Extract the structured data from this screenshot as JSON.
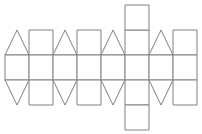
{
  "figure": {
    "background_color": "#ffffff",
    "stroke_color": "#808080",
    "fill_color": "#ffffff",
    "stroke_width": 1,
    "canvas": {
      "width": 202,
      "height": 134
    }
  },
  "grid": {
    "origin_x": 5,
    "origin_y": 5,
    "cell_width": 24,
    "cell_height": 25,
    "columns": 8,
    "row_tops": [
      5,
      30,
      55,
      80,
      105
    ],
    "band_row_index": 2,
    "tall_column_index": 5
  },
  "shapes": [
    {
      "id": "tri-top-1",
      "kind": "triangle",
      "orientation": "up",
      "column": 0,
      "row": 1,
      "points": "5,55 17,30 29,55"
    },
    {
      "id": "sq-top-2",
      "kind": "square",
      "orientation": "none",
      "column": 1,
      "row": 1,
      "points": "29,30 53,30 53,55 29,55"
    },
    {
      "id": "tri-top-3",
      "kind": "triangle",
      "orientation": "up",
      "column": 2,
      "row": 1,
      "points": "53,55 65,30 77,55"
    },
    {
      "id": "sq-top-4",
      "kind": "square",
      "orientation": "none",
      "column": 3,
      "row": 1,
      "points": "77,30 101,30 101,55 77,55"
    },
    {
      "id": "tri-top-5",
      "kind": "triangle",
      "orientation": "up",
      "column": 4,
      "row": 1,
      "points": "101,55 113,30 125,55"
    },
    {
      "id": "sq-top-6",
      "kind": "square",
      "orientation": "none",
      "column": 5,
      "row": 1,
      "points": "125,30 149,30 149,55 125,55"
    },
    {
      "id": "tri-top-7",
      "kind": "triangle",
      "orientation": "up",
      "column": 6,
      "row": 1,
      "points": "149,55 161,30 173,55"
    },
    {
      "id": "sq-top-8",
      "kind": "square",
      "orientation": "none",
      "column": 7,
      "row": 1,
      "points": "173,30 197,30 197,55 173,55"
    },
    {
      "id": "sq-extra-top",
      "kind": "square",
      "orientation": "none",
      "column": 5,
      "row": 0,
      "points": "125,5 149,5 149,30 125,30"
    },
    {
      "id": "band-sq-1",
      "kind": "square",
      "orientation": "none",
      "column": 0,
      "row": 2,
      "points": "5,55 29,55 29,80 5,80"
    },
    {
      "id": "band-sq-2",
      "kind": "square",
      "orientation": "none",
      "column": 1,
      "row": 2,
      "points": "29,55 53,55 53,80 29,80"
    },
    {
      "id": "band-sq-3",
      "kind": "square",
      "orientation": "none",
      "column": 2,
      "row": 2,
      "points": "53,55 77,55 77,80 53,80"
    },
    {
      "id": "band-sq-4",
      "kind": "square",
      "orientation": "none",
      "column": 3,
      "row": 2,
      "points": "77,55 101,55 101,80 77,80"
    },
    {
      "id": "band-sq-5",
      "kind": "square",
      "orientation": "none",
      "column": 4,
      "row": 2,
      "points": "101,55 125,55 125,80 101,80"
    },
    {
      "id": "band-sq-6",
      "kind": "square",
      "orientation": "none",
      "column": 5,
      "row": 2,
      "points": "125,55 149,55 149,80 125,80"
    },
    {
      "id": "band-sq-7",
      "kind": "square",
      "orientation": "none",
      "column": 6,
      "row": 2,
      "points": "149,55 173,55 173,80 149,80"
    },
    {
      "id": "band-sq-8",
      "kind": "square",
      "orientation": "none",
      "column": 7,
      "row": 2,
      "points": "173,55 197,55 197,80 173,80"
    },
    {
      "id": "tri-bot-1",
      "kind": "triangle",
      "orientation": "down",
      "column": 0,
      "row": 3,
      "points": "5,80 29,80 17,105"
    },
    {
      "id": "sq-bot-2",
      "kind": "square",
      "orientation": "none",
      "column": 1,
      "row": 3,
      "points": "29,80 53,80 53,105 29,105"
    },
    {
      "id": "tri-bot-3",
      "kind": "triangle",
      "orientation": "down",
      "column": 2,
      "row": 3,
      "points": "53,80 77,80 65,105"
    },
    {
      "id": "sq-bot-4",
      "kind": "square",
      "orientation": "none",
      "column": 3,
      "row": 3,
      "points": "77,80 101,80 101,105 77,105"
    },
    {
      "id": "tri-bot-5",
      "kind": "triangle",
      "orientation": "down",
      "column": 4,
      "row": 3,
      "points": "101,80 125,80 113,105"
    },
    {
      "id": "sq-bot-6",
      "kind": "square",
      "orientation": "none",
      "column": 5,
      "row": 3,
      "points": "125,80 149,80 149,105 125,105"
    },
    {
      "id": "tri-bot-7",
      "kind": "triangle",
      "orientation": "down",
      "column": 6,
      "row": 3,
      "points": "149,80 173,80 161,105"
    },
    {
      "id": "sq-bot-8",
      "kind": "square",
      "orientation": "none",
      "column": 7,
      "row": 3,
      "points": "173,80 197,80 197,105 173,105"
    },
    {
      "id": "sq-extra-bottom",
      "kind": "square",
      "orientation": "none",
      "column": 5,
      "row": 4,
      "points": "125,105 149,105 149,130 125,130"
    }
  ]
}
